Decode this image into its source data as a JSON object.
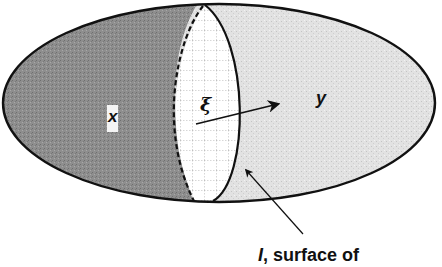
{
  "diagram": {
    "regions": {
      "left_region_label": "x",
      "interface_label": "ξ",
      "right_region_label": "y"
    },
    "caption": {
      "symbol": "I",
      "text": ", surface of"
    },
    "colors": {
      "left_fill": "#8e8e8e",
      "right_fill": "#dedede",
      "interface_fill": "#ffffff",
      "grid_lines": "#9a9a9a",
      "outline": "#111111"
    }
  }
}
